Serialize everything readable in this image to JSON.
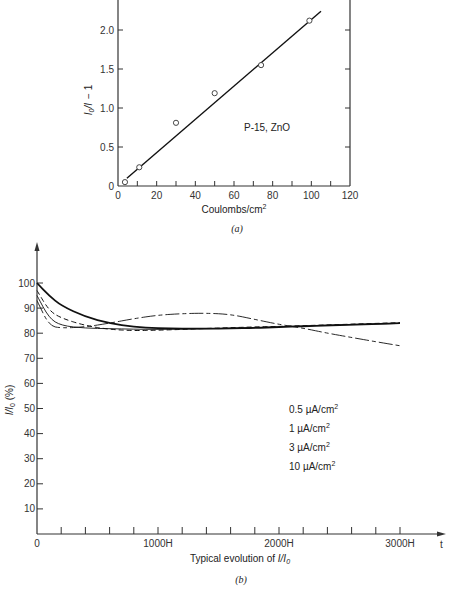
{
  "chart_data": [
    {
      "id": "a",
      "type": "scatter",
      "caption": "(a)",
      "title": "",
      "xlabel": "Coulombs/cm²",
      "ylabel": "I₀/I − 1",
      "xlim": [
        0,
        120
      ],
      "ylim": [
        0,
        2.4
      ],
      "x_ticks": [
        "0",
        "20",
        "40",
        "60",
        "80",
        "100",
        "120"
      ],
      "y_ticks": [
        "0",
        "0.5",
        "1.0",
        "1.5",
        "2.0"
      ],
      "annotation": "P-15, ZnO",
      "grid": false,
      "series": [
        {
          "name": "measured",
          "marker": "open-circle",
          "x": [
            3.6,
            11,
            30,
            50,
            74,
            99
          ],
          "y": [
            0.05,
            0.24,
            0.81,
            1.19,
            1.55,
            2.12
          ]
        },
        {
          "name": "linear fit",
          "style": "solid-line",
          "x": [
            4.6,
            105
          ],
          "y": [
            0.1,
            2.24
          ]
        }
      ]
    },
    {
      "id": "b",
      "type": "line",
      "caption": "(b)",
      "title": "Typical evolution of I/I₀",
      "xlabel": "Typical evolution of I/I₀",
      "xaxis_end_label": "t",
      "ylabel": "I/I₀ (%)",
      "xlim": [
        0,
        3000
      ],
      "ylim": [
        0,
        100
      ],
      "x_ticks": [
        "0",
        "1000H",
        "2000H",
        "3000H"
      ],
      "x_minor_tick_step": 200,
      "y_ticks": [
        "10",
        "20",
        "30",
        "40",
        "50",
        "60",
        "70",
        "80",
        "90",
        "100"
      ],
      "grid": false,
      "legend_position": "right-middle",
      "x": [
        0,
        100,
        200,
        400,
        600,
        800,
        1000,
        1200,
        1400,
        1600,
        1800,
        2000,
        2200,
        2400,
        2600,
        2800,
        3000
      ],
      "series": [
        {
          "name": "0.5 µA/cm²",
          "style": "solid-thick",
          "values": [
            100,
            95,
            91,
            86.5,
            84,
            82.5,
            82,
            81.8,
            81.8,
            81.9,
            82.1,
            82.4,
            82.8,
            83.1,
            83.4,
            83.7,
            84
          ]
        },
        {
          "name": "1 µA/cm²",
          "style": "dashed",
          "values": [
            97,
            89,
            86,
            83,
            81.5,
            81,
            81.2,
            81.5,
            81.9,
            82.2,
            82.5,
            82.7,
            83,
            83.3,
            83.6,
            83.9,
            84.2
          ]
        },
        {
          "name": "3 µA/cm²",
          "style": "long-dash-short-dash",
          "values": [
            93,
            83,
            82,
            82.5,
            84,
            85.8,
            87.2,
            87.8,
            88,
            87.5,
            85.5,
            83.5,
            82,
            80,
            78.3,
            76.6,
            75
          ]
        },
        {
          "name": "10 µA/cm²",
          "style": "thin-solid",
          "values": [
            95,
            86,
            83,
            82,
            81.8,
            81.6,
            81.5,
            81.6,
            81.8,
            82,
            82.3,
            82.6,
            82.9,
            83.2,
            83.5,
            83.7,
            83.9
          ]
        }
      ],
      "legend_entries": [
        "0.5 µA/cm²",
        "1 µA/cm²",
        "3 µA/cm²",
        "10 µA/cm²"
      ]
    }
  ]
}
